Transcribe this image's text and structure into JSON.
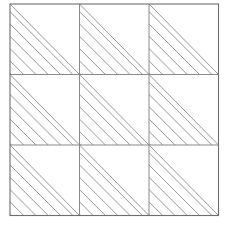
{
  "figure": {
    "canvas": {
      "width": 230,
      "height": 225,
      "background_color": "#ffffff"
    },
    "grid": {
      "rows": 3,
      "columns": 3,
      "origin_x": 10,
      "origin_y": 4,
      "cell_width": 69.5,
      "cell_height": 70.5,
      "total_width": 208.5,
      "total_height": 211.5,
      "border_color": "#6e6e6e",
      "border_width": 1.1,
      "inner_line_color": "#8a8a8a",
      "inner_line_width": 1.0
    },
    "hatch": {
      "color": "#8c8c8c",
      "line_width": 0.9,
      "spacing": 8.7,
      "angle_degrees": -45,
      "direction": "top-left to bottom-right",
      "filled_region": "lower-left triangle",
      "lines_per_cell": 8
    },
    "cells": [
      {
        "row": 0,
        "col": 0,
        "name": "cell-r0-c0",
        "hatched": true,
        "triangle": "lower-left",
        "hatch_direction": "negative-slope"
      },
      {
        "row": 0,
        "col": 1,
        "name": "cell-r0-c1",
        "hatched": true,
        "triangle": "lower-left",
        "hatch_direction": "negative-slope"
      },
      {
        "row": 0,
        "col": 2,
        "name": "cell-r0-c2",
        "hatched": true,
        "triangle": "lower-left",
        "hatch_direction": "negative-slope"
      },
      {
        "row": 1,
        "col": 0,
        "name": "cell-r1-c0",
        "hatched": true,
        "triangle": "lower-left",
        "hatch_direction": "negative-slope"
      },
      {
        "row": 1,
        "col": 1,
        "name": "cell-r1-c1",
        "hatched": true,
        "triangle": "lower-left",
        "hatch_direction": "negative-slope"
      },
      {
        "row": 1,
        "col": 2,
        "name": "cell-r1-c2",
        "hatched": true,
        "triangle": "lower-left",
        "hatch_direction": "negative-slope"
      },
      {
        "row": 2,
        "col": 0,
        "name": "cell-r2-c0",
        "hatched": true,
        "triangle": "lower-left",
        "hatch_direction": "negative-slope"
      },
      {
        "row": 2,
        "col": 1,
        "name": "cell-r2-c1",
        "hatched": true,
        "triangle": "lower-left",
        "hatch_direction": "negative-slope"
      },
      {
        "row": 2,
        "col": 2,
        "name": "cell-r2-c2",
        "hatched": true,
        "triangle": "lower-left",
        "hatch_direction": "negative-slope"
      }
    ]
  }
}
